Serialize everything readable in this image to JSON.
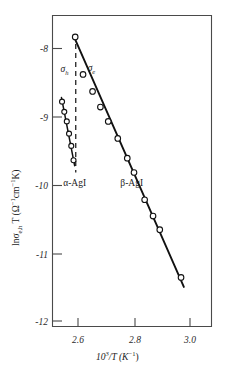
{
  "chart_data": {
    "type": "scatter",
    "title": "",
    "xlabel": "10³/T (K⁻¹)",
    "ylabel": "ln σe,h T (Ω⁻¹cm⁻¹K)",
    "xlim": [
      2.53,
      3.06
    ],
    "ylim": [
      -12.2,
      -7.55
    ],
    "xticks": [
      2.6,
      2.8,
      3.0
    ],
    "xticklabels": [
      "2.6",
      "2.8",
      "3.0"
    ],
    "yticks": [
      -8,
      -9,
      -10,
      -11,
      -12
    ],
    "yticklabels": [
      "-8",
      "-9",
      "-10",
      "-11",
      "-12"
    ],
    "grid": false,
    "legend_position": "inline-annotations",
    "series": [
      {
        "name": "σh",
        "phase": "α-AgI",
        "marker": "open-circle",
        "line": "solid",
        "x": [
          2.543,
          2.551,
          2.56,
          2.568,
          2.576,
          2.584
        ],
        "y": [
          -8.78,
          -8.93,
          -9.07,
          -9.25,
          -9.43,
          -9.64
        ]
      },
      {
        "name": "σe",
        "phase": "β-AgI",
        "marker": "open-circle",
        "line": "solid",
        "x": [
          2.59,
          2.618,
          2.652,
          2.68,
          2.708,
          2.742,
          2.776,
          2.8,
          2.838,
          2.868,
          2.892,
          2.968
        ],
        "y": [
          -7.83,
          -8.38,
          -8.63,
          -8.86,
          -9.07,
          -9.32,
          -9.61,
          -9.82,
          -10.22,
          -10.46,
          -10.66,
          -11.36
        ]
      }
    ],
    "fit_lines": [
      {
        "name": "σh-fit",
        "x": [
          2.541,
          2.588
        ],
        "y": [
          -8.72,
          -9.72
        ]
      },
      {
        "name": "σe-fit",
        "x": [
          2.589,
          2.978
        ],
        "y": [
          -7.86,
          -11.5
        ]
      }
    ],
    "vertical_marker": {
      "name": "phase-transition",
      "x": 2.592,
      "y_top": -7.8,
      "y_bottom": -9.82,
      "style": "dashed"
    },
    "annotations": [
      {
        "name": "sigma-h-label",
        "text": "σh",
        "base": "σ",
        "sub": "h",
        "x": 2.552,
        "y": -8.35
      },
      {
        "name": "sigma-e-label",
        "text": "σe",
        "base": "σ",
        "sub": "e",
        "x": 2.648,
        "y": -8.33
      },
      {
        "name": "alpha-agi-label",
        "text": "α-AgI",
        "x": 2.588,
        "y": -10.02
      },
      {
        "name": "beta-agi-label",
        "text": "β-AgI",
        "x": 2.792,
        "y": -10.02
      }
    ]
  },
  "axis": {
    "x_title_num": "10",
    "x_title_num_sup": "3",
    "x_title_mid": "/T (K",
    "x_title_sup": "−1",
    "x_title_end": ")",
    "y_title_ln": "ln",
    "y_title_sigma": "σ",
    "y_title_sigma_sub": "e,h",
    "y_title_T": " T (Ω",
    "y_title_sup1": "−1",
    "y_title_cm": "cm",
    "y_title_sup2": "−1",
    "y_title_K": "K)"
  },
  "colors": {
    "axis": "#4a4a4a",
    "data": "#111111",
    "marker_fill": "#ffffff",
    "background": "#ffffff"
  }
}
